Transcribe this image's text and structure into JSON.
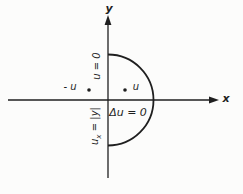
{
  "colors": {
    "ink": "#1f1f1f",
    "paper": "#fcfcfb"
  },
  "axes": {
    "x_label": "x",
    "y_label": "y"
  },
  "labels": {
    "upper_boundary": "u = 0",
    "lower_boundary": {
      "var": "u",
      "sub": "x",
      "rest": " = |y|"
    },
    "domain_equation": "Δu = 0",
    "point_left": "- u",
    "point_right": "u"
  }
}
